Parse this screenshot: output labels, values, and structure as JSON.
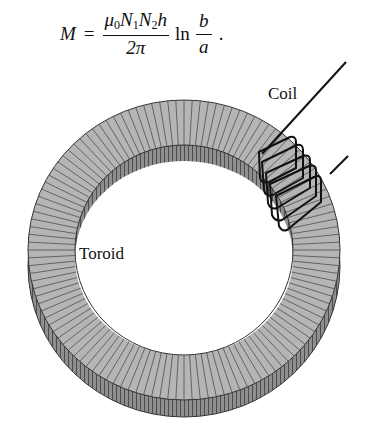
{
  "equation": {
    "lhs": "M",
    "equals": "=",
    "numerator_mu": "μ",
    "numerator_mu_sub": "0",
    "numerator_N1": "N",
    "numerator_N1_sub": "1",
    "numerator_N2": "N",
    "numerator_N2_sub": "2",
    "numerator_h": "h",
    "denominator": "2π",
    "log": "ln",
    "log_numerator": "b",
    "log_denominator": "a",
    "terminator": "."
  },
  "labels": {
    "coil": "Coil",
    "toroid": "Toroid"
  },
  "colors": {
    "toroid_top": "#b4b4b4",
    "toroid_side": "#8c8c8c",
    "hatch_lines": "#4a4a4a",
    "coil_wire": "#111111",
    "background": "#ffffff"
  }
}
